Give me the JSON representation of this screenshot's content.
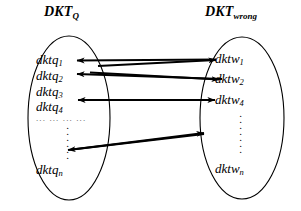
{
  "figure": {
    "type": "set-mapping-diagram",
    "background_color": "#ffffff",
    "stroke_color": "#000000"
  },
  "left_set": {
    "title_main": "DKT",
    "title_sub": "Q",
    "elements": [
      {
        "base": "dktq",
        "sub": "1"
      },
      {
        "base": "dktq",
        "sub": "2"
      },
      {
        "base": "dktq",
        "sub": "3"
      },
      {
        "base": "dktq",
        "sub": "4"
      },
      {
        "base": "dktq",
        "sub": "n"
      }
    ],
    "horizontal_ellipsis": "... ... ... ...",
    "vertical_ellipsis_dots": 4
  },
  "right_set": {
    "title_main": "DKT",
    "title_sub": "wrong",
    "elements": [
      {
        "base": "dktw",
        "sub": "1"
      },
      {
        "base": "dktw",
        "sub": "2"
      },
      {
        "base": "dktw",
        "sub": "4"
      },
      {
        "base": "dktw",
        "sub": "n"
      }
    ],
    "vertical_ellipsis_dots": 4
  },
  "mappings": [
    {
      "from": "dktq_1",
      "to": "dktw_1",
      "direction": "both"
    },
    {
      "from": "dktq_2",
      "to": "dktw_2",
      "direction": "both"
    },
    {
      "from": "dktq_4",
      "to": "dktw_4",
      "direction": "both"
    },
    {
      "from": "dktq_ellipsis",
      "to": "dktw_ellipsis",
      "direction": "both"
    }
  ]
}
